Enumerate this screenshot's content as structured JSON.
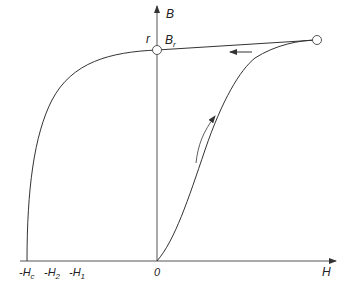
{
  "diagram": {
    "axes": {
      "y_label": "B",
      "x_label": "H",
      "origin_label": "0"
    },
    "labels": {
      "r": "r",
      "Br_main": "B",
      "Br_sub": "r",
      "neg_Hc_main": "-H",
      "neg_Hc_sub": "c",
      "neg_H2_main": "-H",
      "neg_H2_sub": "2",
      "neg_H1_main": "-H",
      "neg_H1_sub": "1"
    },
    "curves": [
      {
        "name": "initial-magnetization",
        "from": "0",
        "to": "saturation-point",
        "direction": "up"
      },
      {
        "name": "recoil-line",
        "from": "saturation-point",
        "to": "Br",
        "direction": "left"
      },
      {
        "name": "demagnetization",
        "from": "Br",
        "to": "-Hc"
      }
    ],
    "colors": {
      "line": "#333333",
      "text": "#222222",
      "marker_fill": "#ffffff"
    }
  }
}
